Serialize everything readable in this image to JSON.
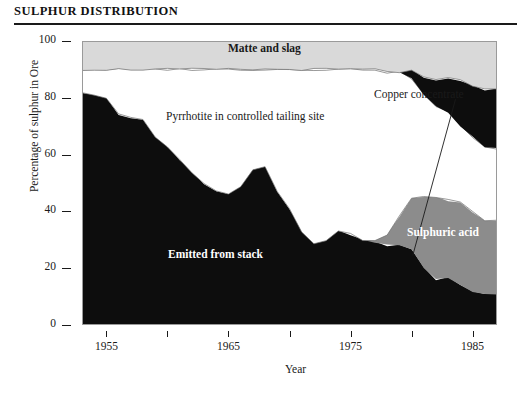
{
  "title": "SULPHUR DISTRIBUTION",
  "chart_data": {
    "type": "area",
    "title": "SULPHUR DISTRIBUTION",
    "xlabel": "Year",
    "ylabel": "Percentage of sulphur in Ore",
    "xlim": [
      1953,
      1987
    ],
    "ylim": [
      0,
      100
    ],
    "grid": false,
    "legend_position": "inline-annotations",
    "stacked": true,
    "xtick_labels": [
      "1955",
      "1965",
      "1975",
      "1985"
    ],
    "xticks_major": [
      1955,
      1965,
      1975,
      1985
    ],
    "xticks_minor": [
      1960,
      1970,
      1980
    ],
    "ytick_labels": [
      "0",
      "20",
      "40",
      "60",
      "80",
      "100"
    ],
    "yticks": [
      0,
      20,
      40,
      60,
      80,
      100
    ],
    "x": [
      1953,
      1954,
      1955,
      1956,
      1957,
      1958,
      1959,
      1960,
      1961,
      1962,
      1963,
      1964,
      1965,
      1966,
      1967,
      1968,
      1969,
      1970,
      1971,
      1972,
      1973,
      1974,
      1975,
      1976,
      1977,
      1978,
      1979,
      1980,
      1981,
      1982,
      1983,
      1984,
      1985,
      1986,
      1987
    ],
    "series": [
      {
        "name": "Emitted from stack",
        "color": "#0d0d0d",
        "label_color": "#ffffff",
        "values": [
          82,
          81,
          80,
          74,
          73,
          72,
          66,
          63,
          58,
          54,
          50,
          47,
          46,
          49,
          55,
          56,
          47,
          41,
          33,
          29,
          30,
          33,
          32,
          30,
          29,
          28,
          28,
          27,
          20,
          16,
          17,
          14,
          12,
          11,
          11
        ]
      },
      {
        "name": "Sulphuric acid",
        "color": "#8c8c8c",
        "label_color": "#ffffff",
        "values": [
          0,
          0,
          0,
          0,
          0,
          0,
          0,
          0,
          0,
          0,
          0,
          0,
          0,
          0,
          0,
          0,
          0,
          0,
          0,
          0,
          0,
          0,
          0,
          0,
          1,
          4,
          10,
          18,
          25,
          29,
          27,
          29,
          28,
          26,
          26
        ]
      },
      {
        "name": "Pyrrhotite in controlled tailing site",
        "color": "#ffffff",
        "label_color": "#1a1a1a",
        "values": [
          8,
          9,
          10,
          16,
          17,
          18,
          24,
          27,
          32,
          36,
          40,
          43,
          44,
          41,
          35,
          34,
          43,
          49,
          57,
          61,
          60,
          57,
          58,
          60,
          60,
          57,
          51,
          42,
          36,
          32,
          31,
          27,
          26,
          26,
          25
        ]
      },
      {
        "name": "Copper concentrate",
        "color": "#0d0d0d",
        "label_color": "#1a1a1a",
        "values": [
          0,
          0,
          0,
          0,
          0,
          0,
          0,
          0,
          0,
          0,
          0,
          0,
          0,
          0,
          0,
          0,
          0,
          0,
          0,
          0,
          0,
          0,
          0,
          0,
          0,
          0,
          0,
          3,
          6,
          9,
          12,
          16,
          18,
          20,
          21
        ]
      },
      {
        "name": "Matte and slag",
        "color": "#d9d9d9",
        "label_color": "#1a1a1a",
        "values": [
          10,
          10,
          10,
          10,
          10,
          10,
          10,
          10,
          10,
          10,
          10,
          10,
          10,
          10,
          10,
          10,
          10,
          10,
          10,
          10,
          10,
          10,
          10,
          10,
          10,
          11,
          11,
          10,
          13,
          14,
          13,
          14,
          16,
          17,
          17
        ]
      }
    ],
    "annotations": [
      {
        "text": "Matte and slag",
        "band": "Matte and slag"
      },
      {
        "text": "Copper concentrate",
        "band": "Copper concentrate",
        "has_leader_line": true
      },
      {
        "text": "Pyrrhotite in controlled tailing site",
        "band": "Pyrrhotite in controlled tailing site"
      },
      {
        "text": "Emitted from stack",
        "band": "Emitted from stack"
      },
      {
        "text": "Sulphuric acid",
        "band": "Sulphuric acid"
      }
    ]
  },
  "colors": {
    "matte_and_slag": "#d9d9d9",
    "copper_concentrate": "#0d0d0d",
    "pyrrhotite": "#ffffff",
    "sulphuric_acid": "#8c8c8c",
    "emitted_from_stack": "#0d0d0d",
    "axis": "#1a1a1a",
    "frame": "#9a9a9a",
    "background": "#ffffff"
  }
}
